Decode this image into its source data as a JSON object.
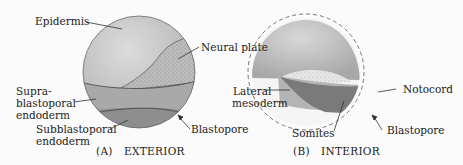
{
  "panel_a": {
    "caption_letter": "(A)",
    "caption_title": "EXTERIOR",
    "labels": {
      "epidermis": "Epidermis",
      "neural_plate": "Neural plate",
      "supra_1": "Supra-",
      "supra_2": "blastoporal",
      "supra_3": "endoderm",
      "sub_1": "Subblastoporal",
      "sub_2": "endoderm",
      "blastopore": "Blastopore"
    }
  },
  "panel_b": {
    "caption_letter": "(B)",
    "caption_title": "INTERIOR",
    "labels": {
      "lateral_1": "Lateral",
      "lateral_2": "mesoderm",
      "notocord": "Notocord",
      "somites": "Somites",
      "blastopore": "Blastopore"
    }
  },
  "colors": {
    "epidermis": "#c9c9c9",
    "neural_plate": "#b8b8b8",
    "supra_endoderm": "#a9a9a9",
    "sub_endoderm": "#8e8e8e",
    "somites": "#7a7a7a",
    "lateral_mesoderm": "#b4b4b4"
  }
}
